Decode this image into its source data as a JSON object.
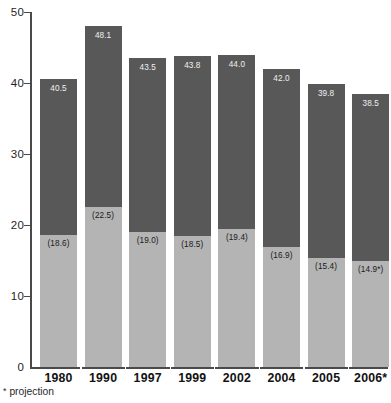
{
  "chart_data": {
    "type": "bar",
    "subtype": "stacked-bar",
    "title": "",
    "xlabel": "",
    "ylabel": "",
    "ylim": [
      0,
      50
    ],
    "yticks": [
      0,
      10,
      20,
      30,
      40,
      50
    ],
    "grid": false,
    "legend": "none",
    "categories": [
      "1980",
      "1990",
      "1997",
      "1999",
      "2002",
      "2004",
      "2005",
      "2006*"
    ],
    "series": [
      {
        "name": "lower-segment",
        "color": "#b4b4b4",
        "values": [
          18.6,
          22.5,
          19.0,
          18.5,
          19.4,
          16.9,
          15.4,
          14.9
        ],
        "labels": [
          "(18.6)",
          "(22.5)",
          "(19.0)",
          "(18.5)",
          "(19.4)",
          "(16.9)",
          "(15.4)",
          "(14.9*)"
        ]
      },
      {
        "name": "upper-segment",
        "color": "#585858",
        "values": [
          21.9,
          25.6,
          24.5,
          25.3,
          24.6,
          25.1,
          24.4,
          23.6
        ],
        "labels": [
          "",
          "",
          "",
          "",
          "",
          "",
          "",
          ""
        ]
      }
    ],
    "totals": [
      40.5,
      48.1,
      43.5,
      43.8,
      44.0,
      42.0,
      39.8,
      38.5
    ],
    "total_labels": [
      "40.5",
      "48.1",
      "43.5",
      "43.8",
      "44.0",
      "42.0",
      "39.8",
      "38.5"
    ],
    "annotations": [
      "* projection"
    ]
  },
  "axis": {
    "y_tick_labels": [
      "50",
      "40",
      "30",
      "20",
      "10",
      "0"
    ]
  },
  "footnote": {
    "marker": "*",
    "text": "projection"
  },
  "colors": {
    "upper_segment": "#585858",
    "lower_segment": "#b4b4b4",
    "axis": "#4a4a4a",
    "total_label_text": "#f0f0f0",
    "lower_label_text": "#1a1a1a",
    "background": "#ffffff"
  }
}
